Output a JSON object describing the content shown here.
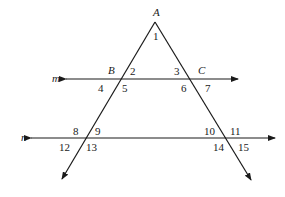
{
  "diagram": {
    "title": "",
    "stroke_color": "#1a1a1a",
    "points": {
      "A": {
        "label": "A"
      },
      "B": {
        "label": "B"
      },
      "C": {
        "label": "C"
      }
    },
    "lines": {
      "m": {
        "label": "m"
      },
      "n": {
        "label": "n"
      }
    },
    "angles": [
      "1",
      "2",
      "3",
      "4",
      "5",
      "6",
      "7",
      "8",
      "9",
      "10",
      "11",
      "12",
      "13",
      "14",
      "15"
    ]
  }
}
